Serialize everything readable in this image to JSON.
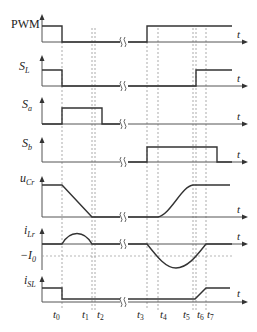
{
  "figure": {
    "type": "timing-diagram",
    "time_axis_label": "t",
    "time_markers": [
      {
        "name": "t",
        "sub": "0",
        "x": 62
      },
      {
        "name": "t",
        "sub": "1",
        "x": 92
      },
      {
        "name": "t",
        "sub": "2",
        "x": 95
      },
      {
        "name": "t",
        "sub": "3",
        "x": 147
      },
      {
        "name": "t",
        "sub": "4",
        "x": 158
      },
      {
        "name": "t",
        "sub": "5",
        "x": 193
      },
      {
        "name": "t",
        "sub": "6",
        "x": 196
      },
      {
        "name": "t",
        "sub": "7",
        "x": 206
      }
    ],
    "break_symbol": "≈",
    "traces": [
      {
        "id": "pwm",
        "label": "PWM",
        "sub": ""
      },
      {
        "id": "sl",
        "label": "S",
        "sub": "L"
      },
      {
        "id": "sa",
        "label": "S",
        "sub": "a"
      },
      {
        "id": "sb",
        "label": "S",
        "sub": "b"
      },
      {
        "id": "ucr",
        "label": "u",
        "sub": "Cr"
      },
      {
        "id": "ilr",
        "label": "i",
        "sub": "Lr",
        "ref_label": "−I",
        "ref_sub": "0"
      },
      {
        "id": "isl",
        "label": "i",
        "sub": "SL"
      }
    ]
  },
  "labels": {
    "pwm": "PWM",
    "sl_main": "S",
    "sl_sub": "L",
    "sa_main": "S",
    "sa_sub": "a",
    "sb_main": "S",
    "sb_sub": "b",
    "ucr_main": "u",
    "ucr_sub": "Cr",
    "ilr_main": "i",
    "ilr_sub": "Lr",
    "i0_main": "−I",
    "i0_sub": "0",
    "isl_main": "i",
    "isl_sub": "SL",
    "t": "t",
    "t0": "0",
    "t1": "1",
    "t2": "2",
    "t3": "3",
    "t4": "4",
    "t5": "5",
    "t6": "6",
    "t7": "7"
  }
}
